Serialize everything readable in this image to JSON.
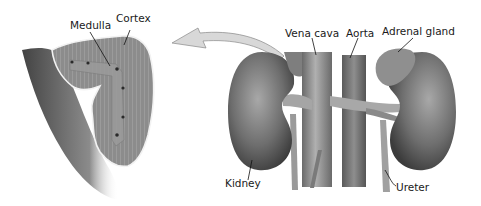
{
  "figure": {
    "labels": {
      "medulla": "Medulla",
      "cortex": "Cortex",
      "vena_cava": "Vena cava",
      "aorta": "Aorta",
      "adrenal_gland": "Adrenal gland",
      "kidney": "Kidney",
      "ureter": "Ureter"
    },
    "colors": {
      "tissue": "#8a8a8a",
      "tissue_light": "#bdbdbd",
      "tissue_dark": "#4a4a4a",
      "outline": "#f2f2f2",
      "arrow_fill": "#d8d8d8",
      "text": "#1a1a1a"
    }
  }
}
